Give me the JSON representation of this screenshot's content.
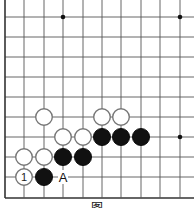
{
  "diagram": {
    "type": "go-board-fragment",
    "grid": {
      "columns_x": [
        5,
        24,
        44,
        63,
        83,
        102,
        121,
        141,
        160,
        180
      ],
      "rows_y": [
        17,
        37,
        57,
        77,
        97,
        117,
        137,
        157,
        177,
        198
      ],
      "right_extends_to": 194,
      "top_extends_to": 0,
      "line_color": "#555555",
      "edge_color": "#333333"
    },
    "star_points": [
      {
        "col": 3,
        "row": 0
      },
      {
        "col": 9,
        "row": 0
      },
      {
        "col": 9,
        "row": 6
      }
    ],
    "stones": [
      {
        "color": "white",
        "col": 2,
        "row": 5,
        "label": ""
      },
      {
        "color": "white",
        "col": 5,
        "row": 5,
        "label": ""
      },
      {
        "color": "white",
        "col": 6,
        "row": 5,
        "label": ""
      },
      {
        "color": "white",
        "col": 3,
        "row": 6,
        "label": ""
      },
      {
        "color": "white",
        "col": 4,
        "row": 6,
        "label": ""
      },
      {
        "color": "black",
        "col": 5,
        "row": 6,
        "label": ""
      },
      {
        "color": "black",
        "col": 6,
        "row": 6,
        "label": ""
      },
      {
        "color": "black",
        "col": 7,
        "row": 6,
        "label": ""
      },
      {
        "color": "white",
        "col": 1,
        "row": 7,
        "label": ""
      },
      {
        "color": "white",
        "col": 2,
        "row": 7,
        "label": ""
      },
      {
        "color": "black",
        "col": 3,
        "row": 7,
        "label": ""
      },
      {
        "color": "black",
        "col": 4,
        "row": 7,
        "label": ""
      },
      {
        "color": "white",
        "col": 1,
        "row": 8,
        "label": "1"
      },
      {
        "color": "black",
        "col": 2,
        "row": 8,
        "label": ""
      }
    ],
    "markers": [
      {
        "text": "A",
        "col": 3,
        "row": 8
      }
    ],
    "caption": "图"
  }
}
